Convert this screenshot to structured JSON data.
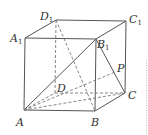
{
  "diagram": {
    "type": "cube",
    "name": "ABCD-A1B1C1D1",
    "line_color": "#555555",
    "points": {
      "A": {
        "x": 24,
        "y": 110,
        "label": "A",
        "sub": ""
      },
      "B": {
        "x": 95,
        "y": 111,
        "label": "B",
        "sub": ""
      },
      "C": {
        "x": 125,
        "y": 93,
        "label": "C",
        "sub": ""
      },
      "D": {
        "x": 55,
        "y": 93,
        "label": "D",
        "sub": ""
      },
      "A1": {
        "x": 25,
        "y": 38,
        "label": "A",
        "sub": "1"
      },
      "B1": {
        "x": 96,
        "y": 39,
        "label": "B",
        "sub": "1"
      },
      "C1": {
        "x": 126,
        "y": 21,
        "label": "C",
        "sub": "1"
      },
      "D1": {
        "x": 56,
        "y": 20,
        "label": "D",
        "sub": "1"
      },
      "P": {
        "x": 115,
        "y": 72,
        "label": "P",
        "sub": ""
      }
    },
    "solid_edges": [
      [
        "A",
        "B"
      ],
      [
        "B",
        "C"
      ],
      [
        "C",
        "C1"
      ],
      [
        "A",
        "A1"
      ],
      [
        "A1",
        "B1"
      ],
      [
        "B1",
        "B"
      ],
      [
        "A1",
        "D1"
      ],
      [
        "D1",
        "C1"
      ],
      [
        "C1",
        "B1"
      ],
      [
        "A",
        "B1"
      ],
      [
        "B1",
        "C"
      ]
    ],
    "dashed_edges": [
      [
        "A",
        "D"
      ],
      [
        "D",
        "C"
      ],
      [
        "D",
        "D1"
      ],
      [
        "A",
        "C"
      ],
      [
        "A",
        "P"
      ],
      [
        "D1",
        "B"
      ]
    ],
    "labels": {
      "A": "A",
      "B": "B",
      "C": "C",
      "D": "D",
      "P": "P",
      "A1": "A",
      "B1": "B",
      "C1": "C",
      "D1": "D",
      "one": "1"
    }
  }
}
